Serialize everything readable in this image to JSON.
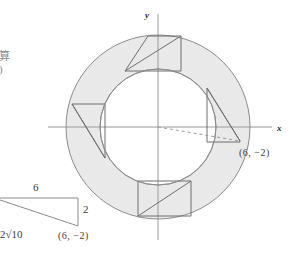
{
  "figure": {
    "axes": {
      "x_label": "x",
      "y_label": "y"
    },
    "point_label_main": "(6,  −2)",
    "point_label_inset": "(6,  −2)",
    "colors": {
      "annulus_fill": "#e9e9e9",
      "stroke": "#8c8c8c",
      "axis": "#8c8c8c",
      "text": "#3d3d3d",
      "dashed": "#9a9a9a"
    },
    "geometry": {
      "center": [
        158,
        127
      ],
      "outer_radius": 92,
      "inner_radius": 58,
      "point": [
        240,
        141
      ]
    }
  },
  "inset_triangle": {
    "top_label": "6",
    "right_label": "2",
    "hyp_label_prefix": "2",
    "hyp_label_root": "√10",
    "point_label": "(6,  −2)"
  },
  "margin_text": {
    "line1": "算",
    "line2": ")"
  }
}
